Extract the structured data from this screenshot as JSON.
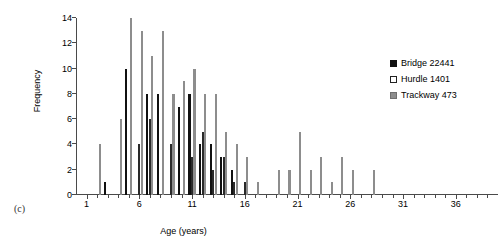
{
  "panel": {
    "label": "(c)"
  },
  "chart_data": {
    "type": "bar",
    "title": "",
    "xlabel": "Age (years)",
    "ylabel": "Frequency",
    "xlim": [
      0,
      40
    ],
    "ylim": [
      0,
      14
    ],
    "xticks": [
      1,
      6,
      11,
      16,
      21,
      26,
      31,
      36
    ],
    "yticks": [
      0,
      2,
      4,
      6,
      8,
      10,
      12,
      14
    ],
    "grid": false,
    "legend_position": "right",
    "categories": [
      2,
      3,
      4,
      5,
      6,
      7,
      8,
      9,
      10,
      11,
      12,
      13,
      14,
      15,
      16,
      17,
      18,
      19,
      20,
      21,
      22,
      23,
      24,
      25,
      26,
      27,
      28
    ],
    "series": [
      {
        "name": "Bridge 22441",
        "color": "#111111",
        "style": "filled-black",
        "values": [
          0,
          1,
          0,
          10,
          0,
          8,
          8,
          0,
          7,
          8,
          4,
          4,
          3,
          2,
          0,
          0,
          0,
          0,
          0,
          0,
          0,
          0,
          0,
          0,
          0,
          0,
          0
        ]
      },
      {
        "name": "Hurdle 1401",
        "color": "#ffffff",
        "style": "open-white",
        "values": [
          0,
          0,
          0,
          0,
          4,
          6,
          0,
          4,
          0,
          3,
          5,
          2,
          3,
          1,
          1,
          0,
          0,
          0,
          0,
          0,
          0,
          0,
          0,
          0,
          0,
          0,
          0
        ]
      },
      {
        "name": "Trackway 473",
        "color": "#8d8d8d",
        "style": "filled-gray",
        "values": [
          4,
          0,
          6,
          14,
          13,
          11,
          13,
          8,
          9,
          10,
          8,
          8,
          5,
          4,
          3,
          1,
          0,
          2,
          2,
          5,
          2,
          3,
          1,
          3,
          2,
          0,
          2
        ]
      }
    ]
  }
}
